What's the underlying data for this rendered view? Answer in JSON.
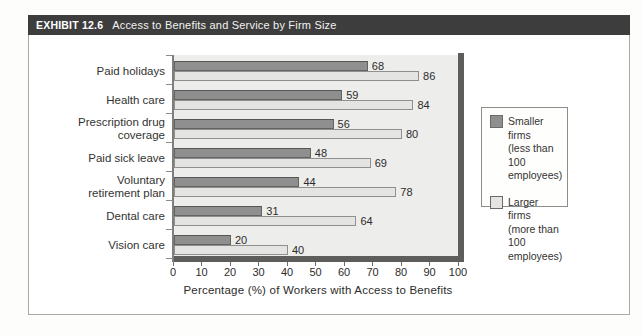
{
  "exhibit": {
    "label": "EXHIBIT 12.6",
    "title": "Access to Benefits and Service by Firm Size"
  },
  "colors": {
    "header_bg": "#3d3d3d",
    "plot_bg": "#ededec",
    "axis_bar": "#5d5d5c",
    "smaller_firms_bar": "#8f8f8f",
    "larger_firms_bar": "#e4e4e2"
  },
  "chart_data": {
    "type": "bar",
    "orientation": "horizontal",
    "title": "Access to Benefits and Service by Firm Size",
    "categories": [
      "Paid holidays",
      "Health care",
      "Prescription drug\ncoverage",
      "Paid sick leave",
      "Voluntary\nretirement plan",
      "Dental care",
      "Vision care"
    ],
    "series": [
      {
        "name": "Smaller firms (less than 100 employees)",
        "color": "#8f8f8f",
        "values": [
          68,
          59,
          56,
          48,
          44,
          31,
          20
        ]
      },
      {
        "name": "Larger firms (more than 100 employees)",
        "color": "#e4e4e2",
        "values": [
          86,
          84,
          80,
          69,
          78,
          64,
          40
        ]
      }
    ],
    "xlabel": "Percentage (%) of Workers with Access to Benefits",
    "xlim": [
      0,
      100
    ],
    "xticks": [
      0,
      10,
      20,
      30,
      40,
      50,
      60,
      70,
      80,
      90,
      100
    ],
    "grid": "off",
    "legend": {
      "position": "right",
      "entries": [
        {
          "label": "Smaller firms\n(less than\n100 employees)"
        },
        {
          "label": "Larger firms\n(more than\n100 employees)"
        }
      ]
    }
  }
}
